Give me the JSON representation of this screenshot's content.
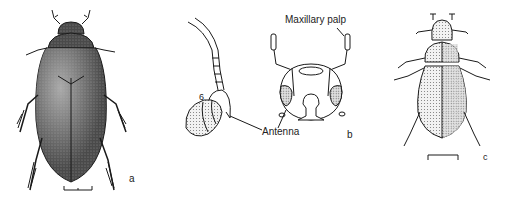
{
  "figure": {
    "panels": [
      {
        "id": "a",
        "letter": "a",
        "description": "dorsal view of dark beetle",
        "has_scale_bar": true
      },
      {
        "id": "b",
        "letter": "b",
        "labels": {
          "antenna": "Antenna",
          "maxillary_palp": "Maxillary palp",
          "segment_number": "6"
        },
        "has_scale_bar": false
      },
      {
        "id": "c",
        "letter": "c",
        "description": "dorsal view of light stippled beetle",
        "has_scale_bar": true
      }
    ],
    "colors": {
      "ink": "#1a1a1a",
      "stipple_dark": "#3a3a3a",
      "stipple_light": "#bdbdbd",
      "background": "#ffffff"
    }
  }
}
